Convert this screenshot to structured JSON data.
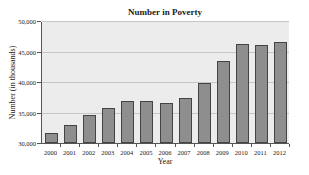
{
  "chart_data": {
    "type": "bar",
    "title": "Number in Poverty",
    "xlabel": "Year",
    "ylabel": "Number (in thousands)",
    "ylim": [
      30000,
      50000
    ],
    "yticks": [
      "30,000",
      "35,000",
      "40,000",
      "45,000",
      "50,000"
    ],
    "grid": true,
    "categories": [
      "2000",
      "2001",
      "2002",
      "2003",
      "2004",
      "2005",
      "2006",
      "2007",
      "2008",
      "2009",
      "2010",
      "2011",
      "2012"
    ],
    "values": [
      31600,
      32900,
      34600,
      35800,
      36900,
      36900,
      36500,
      37300,
      39800,
      43400,
      46200,
      46000,
      46500
    ],
    "bar_color": "#8e8e8e"
  }
}
